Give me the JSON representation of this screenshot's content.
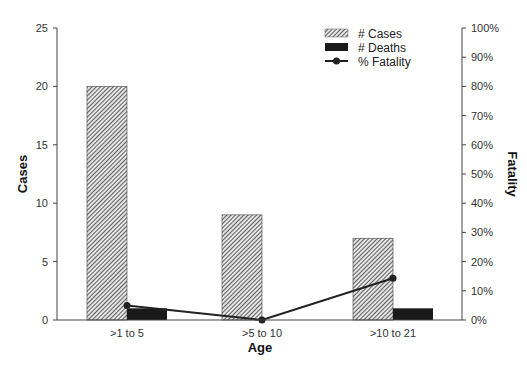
{
  "chart_data": {
    "type": "bar",
    "combo": "bar + line (secondary axis)",
    "title": "",
    "xlabel": "Age",
    "ylabel": "Cases",
    "y2label": "Fatality",
    "categories": [
      ">1 to 5",
      ">5 to 10",
      ">10 to 21"
    ],
    "series": [
      {
        "name": "# Cases",
        "type": "bar",
        "axis": "left",
        "values": [
          20,
          9,
          7
        ]
      },
      {
        "name": "# Deaths",
        "type": "bar",
        "axis": "left",
        "values": [
          1,
          0,
          1
        ]
      },
      {
        "name": "% Fatality",
        "type": "line",
        "axis": "right",
        "values": [
          5,
          0,
          14.3
        ]
      }
    ],
    "ylim": [
      0,
      25
    ],
    "y_ticks": [
      "0",
      "5",
      "10",
      "15",
      "20",
      "25"
    ],
    "y2lim": [
      0,
      100
    ],
    "y2_ticks": [
      "0%",
      "10%",
      "20%",
      "30%",
      "40%",
      "50%",
      "60%",
      "70%",
      "80%",
      "90%",
      "100%"
    ],
    "grid": false,
    "legend_position": "top-right (inside)"
  },
  "colors": {
    "cases_hatch": "#555555",
    "deaths": "#1a1a1a",
    "line": "#222222",
    "axis": "#444444"
  }
}
